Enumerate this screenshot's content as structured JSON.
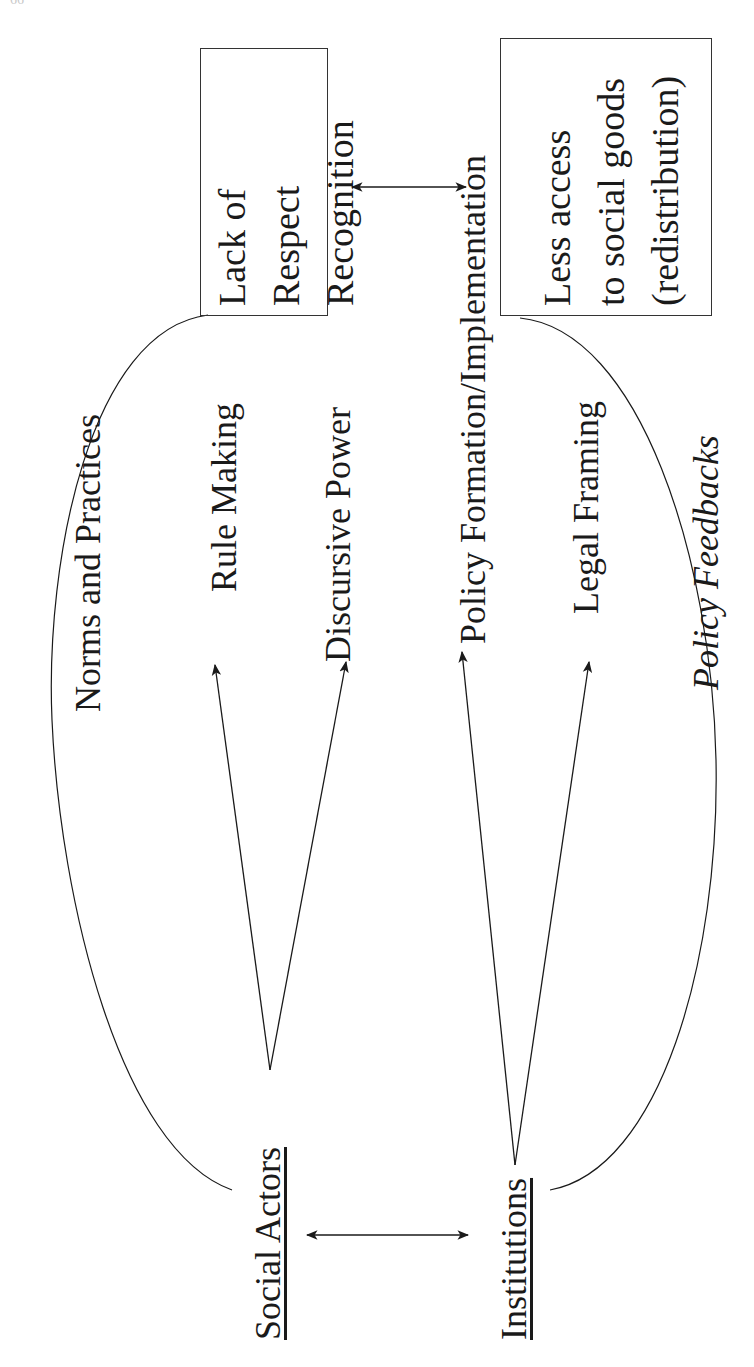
{
  "page": {
    "page_number": "66"
  },
  "boxes": {
    "recognition": {
      "lines": [
        "Lack of",
        "Respect",
        "Recognition"
      ]
    },
    "redistribution": {
      "lines": [
        "Less access",
        "to social goods",
        "(redistribution)"
      ]
    }
  },
  "nodes": {
    "social_actors": "Social Actors",
    "institutions": "Institutions"
  },
  "labels": {
    "norms_and_practices": "Norms and Practices",
    "rule_making": "Rule Making",
    "discursive_power": "Discursive Power",
    "policy_formation": "Policy Formation/Implementation",
    "legal_framing": "Legal Framing",
    "policy_feedbacks": "Policy Feedbacks"
  },
  "edges": [
    {
      "from": "recognition",
      "to": "redistribution",
      "type": "bidirectional"
    },
    {
      "from": "social_actors",
      "to": "institutions",
      "type": "bidirectional"
    },
    {
      "from": "social_actors",
      "to": "rule_making",
      "type": "directed"
    },
    {
      "from": "social_actors",
      "to": "discursive_power",
      "type": "directed"
    },
    {
      "from": "institutions",
      "to": "policy_formation",
      "type": "directed"
    },
    {
      "from": "institutions",
      "to": "legal_framing",
      "type": "directed"
    },
    {
      "from": "social_actors",
      "to": "recognition",
      "type": "curve",
      "label": "norms_and_practices"
    },
    {
      "from": "institutions",
      "to": "redistribution",
      "type": "curve",
      "label": "policy_feedbacks"
    }
  ],
  "colors": {
    "ink": "#1a1a1a",
    "background": "#ffffff"
  }
}
